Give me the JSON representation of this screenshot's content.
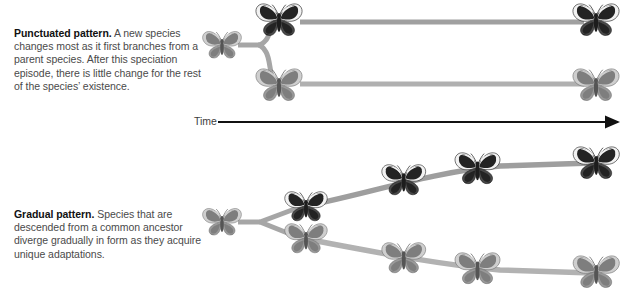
{
  "figure": {
    "type": "diagram",
    "background_color": "#ffffff",
    "branch_color_dark": "#9a9a9a",
    "branch_color_light": "#b5b5b5",
    "axis_color": "#1a1a1a",
    "text_color": "#4a4a4a",
    "lead_text_color": "#111111"
  },
  "panels": {
    "punctuated": {
      "lead": "Punctuated pattern.",
      "body": " A new species changes most as it first branches from a parent species. After this speciation episode, there is little change for the rest of the species’ existence.",
      "full_text": "Punctuated pattern. A new species changes most as it first branches from a parent species. After this speciation episode, there is little change for the rest of the species’ existence."
    },
    "gradual": {
      "lead": "Gradual pattern.",
      "body": " Species that are descended from a common ancestor diverge gradually in form as they acquire unique adaptations.",
      "full_text": "Gradual pattern. Species that are descended from a common ancestor diverge gradually in form as they acquire unique adaptations."
    }
  },
  "axis": {
    "label": "Time",
    "direction": "left-to-right",
    "arrow": "right-arrow-icon"
  },
  "punctuated_diagram": {
    "ancestor": {
      "name": "ancestor-butterfly",
      "morph": "light",
      "x": 222,
      "y": 45
    },
    "branch_point_x": 262,
    "lineages": [
      {
        "name": "upper-lineage",
        "morph": "dark",
        "nodes": [
          {
            "label": "post-speciation-form",
            "x": 279,
            "y": 20
          },
          {
            "label": "unchanged-descendant",
            "x": 596,
            "y": 20
          }
        ]
      },
      {
        "name": "lower-lineage",
        "morph": "light",
        "nodes": [
          {
            "label": "post-speciation-form",
            "x": 279,
            "y": 85
          },
          {
            "label": "unchanged-descendant",
            "x": 596,
            "y": 85
          }
        ]
      }
    ]
  },
  "gradual_diagram": {
    "ancestor": {
      "name": "ancestor-butterfly",
      "morph": "light",
      "x": 222,
      "y": 222
    },
    "branch_point_x": 262,
    "lineages": [
      {
        "name": "upper-lineage",
        "morph": "dark",
        "nodes": [
          {
            "label": "stage-1",
            "x": 306,
            "y": 206
          },
          {
            "label": "stage-2",
            "x": 404,
            "y": 180
          },
          {
            "label": "stage-3",
            "x": 477,
            "y": 168
          },
          {
            "label": "stage-4",
            "x": 596,
            "y": 163
          }
        ]
      },
      {
        "name": "lower-lineage",
        "morph": "light",
        "nodes": [
          {
            "label": "stage-1",
            "x": 306,
            "y": 238
          },
          {
            "label": "stage-2",
            "x": 404,
            "y": 258
          },
          {
            "label": "stage-3",
            "x": 477,
            "y": 268
          },
          {
            "label": "stage-4",
            "x": 596,
            "y": 272
          }
        ]
      }
    ]
  },
  "icons": {
    "butterfly": "butterfly-icon",
    "arrow": "arrow-right-icon"
  }
}
